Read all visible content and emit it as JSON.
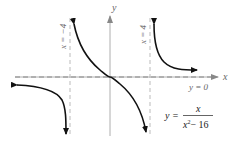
{
  "figure": {
    "type": "function-graph",
    "equation": {
      "lhs": "y =",
      "numerator": "x",
      "denominator_base": "x",
      "denominator_exp": "2",
      "denominator_rest": "− 16"
    },
    "axes": {
      "x_label": "x",
      "y_label": "y",
      "origin_px": [
        110,
        77
      ],
      "unit_px": 10
    },
    "asymptotes": {
      "vertical_left": {
        "label": "x = −4",
        "x": -4
      },
      "vertical_right": {
        "label": "x = 4",
        "x": 4
      },
      "horizontal": {
        "label": "y = 0",
        "y": 0
      }
    },
    "colors": {
      "curve": "#111111",
      "axis": "#999999",
      "asymptote": "#aaaaaa",
      "label": "#666666"
    }
  }
}
